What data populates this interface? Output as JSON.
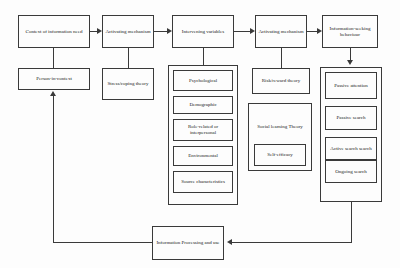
{
  "diagram": {
    "background_color": "#fdfdfd",
    "line_color": "#3a3a3a",
    "text_color": "#1a1a1a"
  },
  "top_row": {
    "context": "Context of information need",
    "activating_mechanism_1": "Activating mechanism",
    "intervening_variables": "Intervening variables",
    "activating_mechanism_2": "Activating mechanism",
    "information_seeking_behaviour": "Information-seeking behaviour"
  },
  "second_row": {
    "person_in_context": "Person-in-context",
    "stress_coping_theory": "Stress/coping theory",
    "risk_reward_theory": "Risk/reward theory"
  },
  "intervening_variables_list": [
    {
      "label": "Psychological"
    },
    {
      "label": "Demographic"
    },
    {
      "label": "Role-related or interpersonal"
    },
    {
      "label": "Environmental"
    },
    {
      "label": "Source characteristics"
    }
  ],
  "social_learning": {
    "title": "Social learning Theory",
    "inner": "Self-efficacy"
  },
  "behaviour_list": [
    {
      "label": "Passive attention"
    },
    {
      "label": "Passive search"
    },
    {
      "label": "Active search search"
    },
    {
      "label": "Ongoing search"
    }
  ],
  "bottom": {
    "information_processing": "Information Processing and use"
  }
}
